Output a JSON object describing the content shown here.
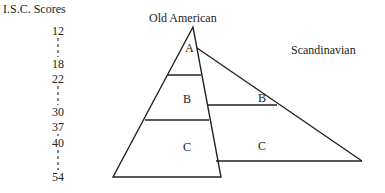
{
  "axis": {
    "title": "I.S.C. Scores",
    "ticks": [
      "12",
      "18",
      "22",
      "30",
      "37",
      "40",
      "54"
    ]
  },
  "groups": [
    {
      "name": "Old American",
      "segments": [
        "A",
        "B",
        "C"
      ]
    },
    {
      "name": "Scandinavian",
      "segments": [
        "B",
        "C"
      ]
    }
  ]
}
